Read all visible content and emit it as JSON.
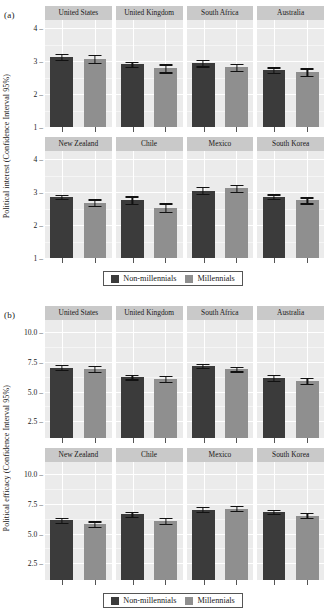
{
  "figure": {
    "legend": {
      "items": [
        {
          "label": "Non-millennials",
          "color": "#3b3b3b"
        },
        {
          "label": "Millennials",
          "color": "#8f8f8f"
        }
      ]
    }
  },
  "panels": {
    "a": {
      "tag": "(a)",
      "ylabel": "Political interest (Confidence Interval 95%)",
      "ticks": [
        "4",
        "3",
        "2",
        "1"
      ]
    },
    "b": {
      "tag": "(b)",
      "ylabel": "Political efficacy (Confidence Interval 95%)",
      "ticks": [
        "10.0",
        "7.5",
        "5.0",
        "2.5"
      ]
    }
  },
  "chart_data": [
    {
      "type": "bar",
      "id": "panel-a",
      "title": "(a)",
      "ylabel": "Political interest (Confidence Interval 95%)",
      "xlabel": "",
      "ylim": [
        1,
        4.25
      ],
      "yticks": [
        1,
        2,
        3,
        4
      ],
      "grid": true,
      "legend_position": "bottom",
      "facet_rows": [
        [
          "United States",
          "United Kingdom",
          "South Africa",
          "Australia"
        ],
        [
          "New Zealand",
          "Chile",
          "Mexico",
          "South Korea"
        ]
      ],
      "categories": [
        "United States",
        "United Kingdom",
        "South Africa",
        "Australia",
        "New Zealand",
        "Chile",
        "Mexico",
        "South Korea"
      ],
      "series": [
        {
          "name": "Non-millennials",
          "color": "#3b3b3b",
          "values": [
            3.12,
            2.9,
            2.94,
            2.72,
            2.85,
            2.75,
            3.05,
            2.86
          ],
          "ci_low": [
            3.03,
            2.82,
            2.84,
            2.64,
            2.79,
            2.64,
            2.95,
            2.8
          ],
          "ci_high": [
            3.21,
            2.98,
            3.04,
            2.81,
            2.92,
            2.87,
            3.15,
            2.93
          ]
        },
        {
          "name": "Millennials",
          "color": "#8f8f8f",
          "values": [
            3.07,
            2.78,
            2.81,
            2.66,
            2.68,
            2.53,
            3.12,
            2.75
          ],
          "ci_low": [
            2.94,
            2.66,
            2.71,
            2.55,
            2.58,
            2.4,
            3.01,
            2.66
          ],
          "ci_high": [
            3.19,
            2.9,
            2.91,
            2.78,
            2.78,
            2.66,
            3.23,
            2.84
          ]
        }
      ]
    },
    {
      "type": "bar",
      "id": "panel-b",
      "title": "(b)",
      "ylabel": "Political efficacy (Confidence Interval 95%)",
      "xlabel": "",
      "ylim": [
        1.1,
        11.0
      ],
      "yticks": [
        2.5,
        5.0,
        7.5,
        10.0
      ],
      "grid": true,
      "legend_position": "bottom",
      "facet_rows": [
        [
          "United States",
          "United Kingdom",
          "South Africa",
          "Australia"
        ],
        [
          "New Zealand",
          "Chile",
          "Mexico",
          "South Korea"
        ]
      ],
      "categories": [
        "United States",
        "United Kingdom",
        "South Africa",
        "Australia",
        "New Zealand",
        "Chile",
        "Mexico",
        "South Korea"
      ],
      "series": [
        {
          "name": "Non-millennials",
          "color": "#3b3b3b",
          "values": [
            7.0,
            6.22,
            7.12,
            6.15,
            6.1,
            6.6,
            7.0,
            6.8
          ],
          "ci_low": [
            6.8,
            6.02,
            6.95,
            5.92,
            5.9,
            6.42,
            6.78,
            6.62
          ],
          "ci_high": [
            7.25,
            6.42,
            7.3,
            6.4,
            6.32,
            6.8,
            7.22,
            6.98
          ]
        },
        {
          "name": "Millennials",
          "color": "#8f8f8f",
          "values": [
            6.88,
            6.05,
            6.88,
            5.88,
            5.78,
            6.08,
            7.1,
            6.5
          ],
          "ci_low": [
            6.62,
            5.82,
            6.68,
            5.62,
            5.55,
            5.82,
            6.88,
            6.28
          ],
          "ci_high": [
            7.14,
            6.28,
            7.08,
            6.15,
            6.02,
            6.34,
            7.32,
            6.72
          ]
        }
      ]
    }
  ]
}
